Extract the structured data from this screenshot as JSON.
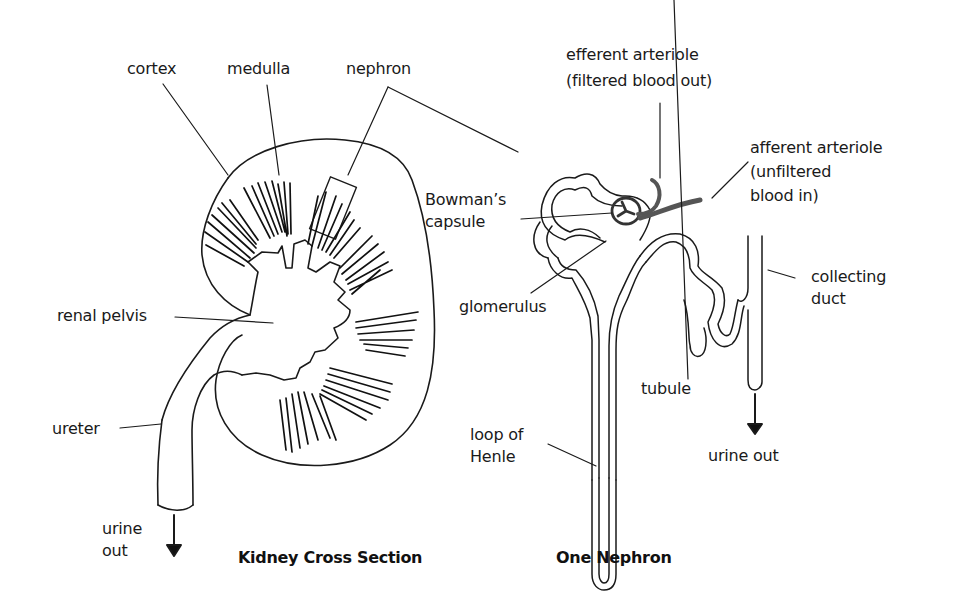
{
  "diagram": {
    "panels": [
      {
        "id": "kidney",
        "title": "Kidney Cross Section",
        "labels": [
          {
            "key": "cortex",
            "text": "cortex"
          },
          {
            "key": "medulla",
            "text": "medulla"
          },
          {
            "key": "nephron",
            "text": "nephron"
          },
          {
            "key": "renal_pelvis",
            "text": "renal pelvis"
          },
          {
            "key": "ureter",
            "text": "ureter"
          },
          {
            "key": "urine_out",
            "text": "urine\nout"
          }
        ]
      },
      {
        "id": "nephron",
        "title": "One Nephron",
        "labels": [
          {
            "key": "efferent_arteriole",
            "text": "efferent arteriole\n(filtered blood out)"
          },
          {
            "key": "afferent_arteriole",
            "text": "afferent arteriole\n(unfiltered\nblood in)"
          },
          {
            "key": "bowmans_capsule",
            "text": "Bowman’s\ncapsule"
          },
          {
            "key": "glomerulus",
            "text": "glomerulus"
          },
          {
            "key": "collecting_duct",
            "text": "collecting\nduct"
          },
          {
            "key": "tubule",
            "text": "tubule"
          },
          {
            "key": "loop_of_henle",
            "text": "loop of\nHenle"
          },
          {
            "key": "urine_out",
            "text": "urine out"
          }
        ]
      }
    ],
    "colors": {
      "line": "#1a1a1a",
      "arteriole": "#555555",
      "background": "#ffffff"
    }
  }
}
